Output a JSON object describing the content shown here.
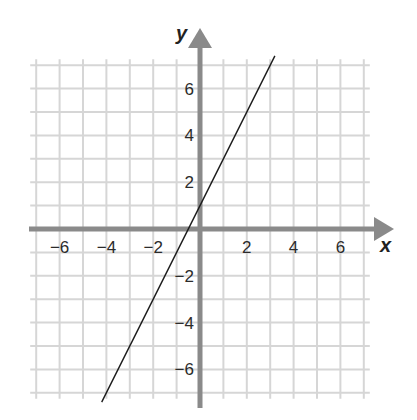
{
  "chart_data": {
    "type": "line",
    "title": "",
    "xlabel": "x",
    "ylabel": "y",
    "xlim": [
      -7.4,
      7.4
    ],
    "ylim": [
      -7.4,
      7.4
    ],
    "grid": true,
    "grid_step": 1,
    "x_ticks": [
      -6,
      -4,
      -2,
      2,
      4,
      6
    ],
    "y_ticks": [
      6,
      4,
      2,
      -2,
      -4,
      -6
    ],
    "x_tick_labels": [
      "−6",
      "−4",
      "−2",
      "2",
      "4",
      "6"
    ],
    "y_tick_labels": [
      "6",
      "4",
      "2",
      "−2",
      "−4",
      "−6"
    ],
    "series": [
      {
        "name": "y = 2x + 1",
        "equation": "y = 2x + 1",
        "slope": 2,
        "intercept": 1,
        "x": [
          -4.2,
          3.2
        ],
        "y": [
          -7.4,
          7.4
        ]
      }
    ],
    "colors": {
      "grid": "#d6d6d6",
      "axes": "#8a8a8a",
      "line": "#1a1a1a",
      "text": "#2b2b2b"
    }
  }
}
